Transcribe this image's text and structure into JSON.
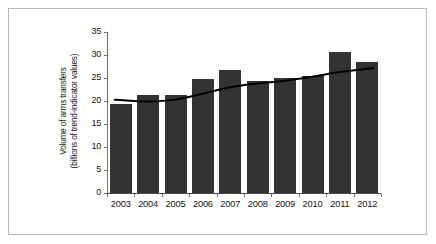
{
  "chart_data": {
    "type": "bar",
    "title": "",
    "subtitle": "",
    "xlabel": "",
    "ylabel": "Volume of arms transfers (billions of trend-indicator values)",
    "ylabel_lines": [
      "Volume of arms transfers",
      "(billions of trend-indicator values)"
    ],
    "categories": [
      "2003",
      "2004",
      "2005",
      "2006",
      "2007",
      "2008",
      "2009",
      "2010",
      "2011",
      "2012"
    ],
    "values": [
      19.3,
      21.3,
      21.3,
      24.7,
      26.8,
      24.3,
      24.9,
      25.5,
      30.6,
      28.4
    ],
    "series": [
      {
        "name": "Volume of arms transfers",
        "type": "bar",
        "values": [
          19.3,
          21.3,
          21.3,
          24.7,
          26.8,
          24.3,
          24.9,
          25.5,
          30.6,
          28.4
        ]
      },
      {
        "name": "Trend",
        "type": "line",
        "values": [
          20.2,
          19.9,
          20.3,
          21.6,
          23.0,
          23.8,
          24.4,
          25.3,
          26.3,
          27.0
        ]
      }
    ],
    "ylim": [
      0,
      35
    ],
    "yticks": [
      0,
      5,
      10,
      15,
      20,
      25,
      30,
      35
    ],
    "ytick_labels": [
      "0",
      "5",
      "10",
      "15",
      "20",
      "25",
      "30",
      "35"
    ],
    "grid": false,
    "legend": false,
    "legend_position": "none",
    "bar_color": "#333333",
    "line_color": "#000000",
    "background_color": "#ffffff",
    "frame_color": "#b8b8b8",
    "axis_color": "#4a4a4a"
  }
}
